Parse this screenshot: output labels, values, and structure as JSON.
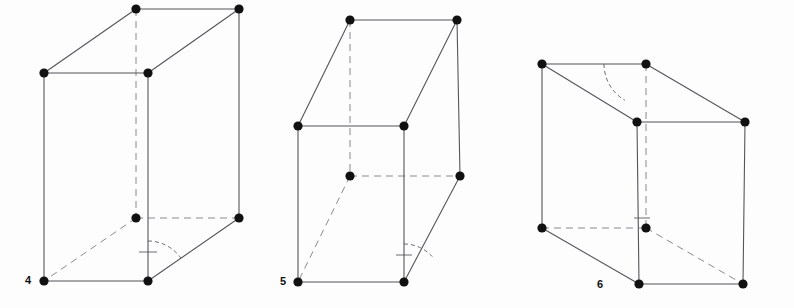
{
  "page": {
    "background_color": "#fdfdfd",
    "width": 794,
    "height": 308
  },
  "style": {
    "edge_color": "#55555a",
    "hidden_edge_color": "#8a8a90",
    "vertex_color": "#111111",
    "arc_color": "#6a6a70",
    "label_color": "#111111",
    "edge_width": 1.1,
    "hidden_edge_width": 1.0,
    "vertex_radius": 4.6,
    "dash_pattern": "7,5"
  },
  "figures": [
    {
      "id": "figure-4",
      "label": "4",
      "label_x": 28,
      "label_y": 284,
      "vertices": [
        {
          "name": "front-top-left",
          "x": 44,
          "y": 73
        },
        {
          "name": "front-top-right",
          "x": 148,
          "y": 73
        },
        {
          "name": "back-top-left",
          "x": 136,
          "y": 9
        },
        {
          "name": "back-top-right",
          "x": 239,
          "y": 9
        },
        {
          "name": "front-bottom-left",
          "x": 44,
          "y": 281
        },
        {
          "name": "front-bottom-right",
          "x": 148,
          "y": 281
        },
        {
          "name": "back-bottom-right",
          "x": 239,
          "y": 218
        },
        {
          "name": "back-bottom-left",
          "x": 136,
          "y": 218
        }
      ],
      "solid_edges": [
        [
          "front-top-left",
          "front-top-right"
        ],
        [
          "front-top-left",
          "back-top-left"
        ],
        [
          "back-top-left",
          "back-top-right"
        ],
        [
          "front-top-right",
          "back-top-right"
        ],
        [
          "back-top-right",
          "back-bottom-right"
        ],
        [
          "front-top-left",
          "front-bottom-left"
        ],
        [
          "front-top-right",
          "front-bottom-right"
        ],
        [
          "front-bottom-left",
          "front-bottom-right"
        ],
        [
          "front-bottom-right",
          "back-bottom-right"
        ]
      ],
      "hidden_edges": [
        [
          "back-top-left",
          "back-bottom-left"
        ],
        [
          "back-bottom-left",
          "back-bottom-right"
        ],
        [
          "back-bottom-left",
          "front-bottom-left"
        ]
      ],
      "angle_marks": [
        {
          "name": "angle-arc-front-bottom-right",
          "type": "arc",
          "cx": 148,
          "cy": 281,
          "r": 40,
          "start_deg": 270,
          "end_deg": 325
        },
        {
          "name": "right-angle-tick-front-bottom-right",
          "type": "tick",
          "x1": 139,
          "y1": 252,
          "x2": 157,
          "y2": 252
        }
      ]
    },
    {
      "id": "figure-5",
      "label": "5",
      "label_x": 283,
      "label_y": 285,
      "vertices": [
        {
          "name": "front-top-left",
          "x": 298,
          "y": 126
        },
        {
          "name": "front-top-right",
          "x": 404,
          "y": 126
        },
        {
          "name": "back-top-left",
          "x": 350,
          "y": 20
        },
        {
          "name": "back-top-right",
          "x": 457,
          "y": 20
        },
        {
          "name": "front-bottom-left",
          "x": 298,
          "y": 282
        },
        {
          "name": "front-bottom-right",
          "x": 404,
          "y": 282
        },
        {
          "name": "back-bottom-right",
          "x": 460,
          "y": 176
        },
        {
          "name": "back-bottom-left",
          "x": 350,
          "y": 176
        }
      ],
      "solid_edges": [
        [
          "front-top-left",
          "front-top-right"
        ],
        [
          "front-top-left",
          "back-top-left"
        ],
        [
          "back-top-left",
          "back-top-right"
        ],
        [
          "front-top-right",
          "back-top-right"
        ],
        [
          "back-top-right",
          "back-bottom-right"
        ],
        [
          "front-top-left",
          "front-bottom-left"
        ],
        [
          "front-top-right",
          "front-bottom-right"
        ],
        [
          "front-bottom-left",
          "front-bottom-right"
        ],
        [
          "front-bottom-right",
          "back-bottom-right"
        ]
      ],
      "hidden_edges": [
        [
          "back-top-left",
          "back-bottom-left"
        ],
        [
          "back-bottom-left",
          "back-bottom-right"
        ],
        [
          "back-bottom-left",
          "front-bottom-left"
        ]
      ],
      "angle_marks": [
        {
          "name": "angle-arc-front-bottom-right",
          "type": "arc",
          "cx": 404,
          "cy": 282,
          "r": 38,
          "start_deg": 270,
          "end_deg": 318
        },
        {
          "name": "right-angle-tick-front-bottom-right",
          "type": "tick",
          "x1": 396,
          "y1": 255,
          "x2": 412,
          "y2": 255
        }
      ]
    },
    {
      "id": "figure-6",
      "label": "6",
      "label_x": 600,
      "label_y": 288,
      "vertices": [
        {
          "name": "back-top-left",
          "x": 542,
          "y": 64
        },
        {
          "name": "back-top-right",
          "x": 646,
          "y": 64
        },
        {
          "name": "front-top-left",
          "x": 637,
          "y": 122
        },
        {
          "name": "front-top-right",
          "x": 745,
          "y": 122
        },
        {
          "name": "back-bottom-left",
          "x": 542,
          "y": 228
        },
        {
          "name": "front-bottom-left",
          "x": 639,
          "y": 284
        },
        {
          "name": "front-bottom-right",
          "x": 743,
          "y": 284
        },
        {
          "name": "back-bottom-right",
          "x": 646,
          "y": 228
        }
      ],
      "solid_edges": [
        [
          "back-top-left",
          "back-top-right"
        ],
        [
          "back-top-left",
          "front-top-left"
        ],
        [
          "back-top-right",
          "front-top-right"
        ],
        [
          "front-top-left",
          "front-top-right"
        ],
        [
          "back-top-left",
          "back-bottom-left"
        ],
        [
          "front-top-left",
          "front-bottom-left"
        ],
        [
          "front-top-right",
          "front-bottom-right"
        ],
        [
          "back-bottom-left",
          "front-bottom-left"
        ],
        [
          "front-bottom-left",
          "front-bottom-right"
        ]
      ],
      "hidden_edges": [
        [
          "back-top-right",
          "back-bottom-right"
        ],
        [
          "back-bottom-left",
          "back-bottom-right"
        ],
        [
          "back-bottom-right",
          "front-bottom-right"
        ]
      ],
      "angle_marks": [
        {
          "name": "angle-arc-back-top-right",
          "type": "arc",
          "cx": 646,
          "cy": 64,
          "r": 42,
          "start_deg": 180,
          "end_deg": 120
        },
        {
          "name": "right-angle-tick-back-bottom-right",
          "type": "tick",
          "x1": 634,
          "y1": 218,
          "x2": 650,
          "y2": 218
        }
      ]
    }
  ]
}
